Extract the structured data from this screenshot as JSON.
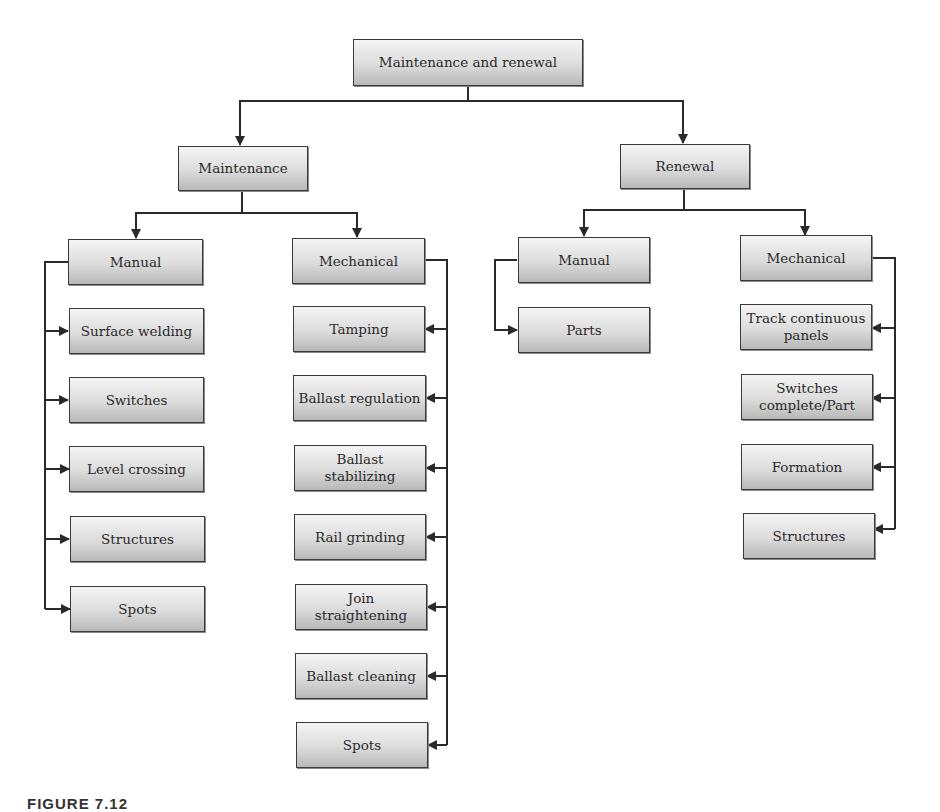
{
  "diagram": {
    "root": "Maintenance and renewal",
    "maintenance": {
      "label": "Maintenance",
      "manual": {
        "label": "Manual",
        "items": [
          "Surface welding",
          "Switches",
          "Level crossing",
          "Structures",
          "Spots"
        ]
      },
      "mechanical": {
        "label": "Mechanical",
        "items": [
          "Tamping",
          "Ballast regulation",
          "Ballast stabilizing",
          "Rail grinding",
          "Join straightening",
          "Ballast cleaning",
          "Spots"
        ]
      }
    },
    "renewal": {
      "label": "Renewal",
      "manual": {
        "label": "Manual",
        "items": [
          "Parts"
        ]
      },
      "mechanical": {
        "label": "Mechanical",
        "items": [
          "Track continuous panels",
          "Switches complete/Part",
          "Formation",
          "Structures"
        ]
      }
    }
  },
  "caption": "FIGURE 7.12",
  "colors": {
    "line": "#2a2a2a",
    "box_top": "#f4f4f4",
    "box_bottom": "#b8b8b8",
    "border": "#3a3a3a"
  }
}
